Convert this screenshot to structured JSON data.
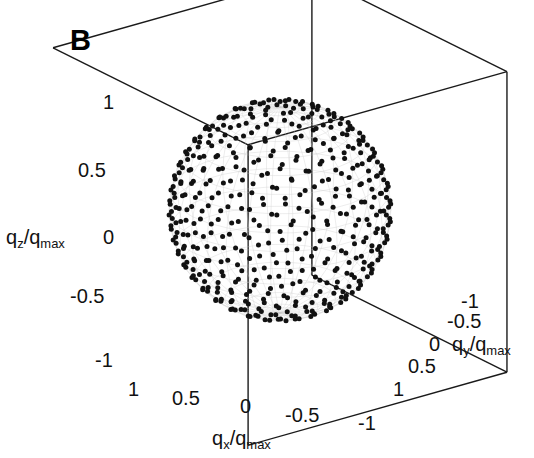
{
  "figure": {
    "panel_label": "B",
    "background_color": "#ffffff",
    "ink_color": "#000000",
    "mesh_color": "#c8c8c8",
    "box_color": "#1a1a1a"
  },
  "axes": {
    "z": {
      "title_main": "q",
      "title_sub": "z",
      "title_denom_main": "q",
      "title_denom_sub": "max",
      "title_text": "qz/qmax",
      "ticks": [
        "1",
        "0.5",
        "0",
        "-0.5",
        "-1"
      ]
    },
    "x": {
      "title_main": "q",
      "title_sub": "x",
      "title_denom_main": "q",
      "title_denom_sub": "max",
      "title_text": "qx/qmax",
      "ticks": [
        "1",
        "0.5",
        "0",
        "-0.5",
        "-1"
      ]
    },
    "y": {
      "title_main": "q",
      "title_sub": "y",
      "title_denom_main": "q",
      "title_denom_sub": "max",
      "title_text": "qy/qmax",
      "ticks": [
        "-1",
        "-0.5",
        "0",
        "0.5",
        "1"
      ]
    }
  },
  "chart_data": {
    "type": "scatter",
    "title": "B",
    "xlabel": "qx/qmax",
    "ylabel": "qy/qmax",
    "zlabel": "qz/qmax",
    "xlim": [
      1,
      -1
    ],
    "ylim": [
      -1,
      1
    ],
    "zlim": [
      -1,
      1
    ],
    "xticks": [
      1,
      0.5,
      0,
      -0.5,
      -1
    ],
    "yticks": [
      -1,
      -0.5,
      0,
      0.5,
      1
    ],
    "zticks": [
      1,
      0.5,
      0,
      -0.5,
      -1
    ],
    "grid": false,
    "legend": "none",
    "point_radius_normalized": 1.0,
    "n_points": 492,
    "marker_color": "#111111",
    "marker_size_px": 5,
    "sphere": {
      "center_normalized": [
        0,
        0,
        0
      ],
      "radius_normalized": 1.0,
      "mesh_parallels": 18,
      "mesh_meridians": 30
    },
    "projection": {
      "azimuth_deg": 37,
      "elevation_deg": 22,
      "center_px": [
        280,
        210
      ],
      "radius_px": 111
    }
  }
}
